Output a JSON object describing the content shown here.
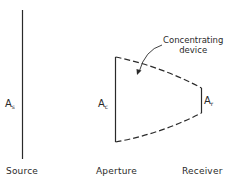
{
  "diagram": {
    "type": "concentrator-schematic",
    "callout": {
      "line1": "Concentrating",
      "line2": "device"
    },
    "areas": {
      "source": {
        "symbol": "A",
        "subscript": "s"
      },
      "aperture": {
        "symbol": "A",
        "subscript": "c"
      },
      "receiver": {
        "symbol": "A",
        "subscript": "r"
      }
    },
    "labels": {
      "source": "Source",
      "aperture": "Aperture",
      "receiver": "Receiver"
    },
    "colors": {
      "line": "#2a2a2a",
      "background": "#ffffff"
    }
  }
}
